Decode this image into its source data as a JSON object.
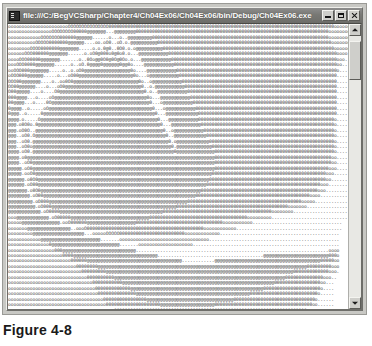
{
  "figure": {
    "caption": "Figure 4-8"
  },
  "window": {
    "title": "file:///C:/BegVCSharp/Chapter4/Ch04Ex06/Ch04Ex06/bin/Debug/Ch04Ex06.exe",
    "icon": "console-window-icon",
    "controls": {
      "minimize_label": "Minimize",
      "maximize_label": "Maximize",
      "close_label": "Close"
    }
  },
  "scrollbar": {
    "up_arrow_label": "Scroll up",
    "down_arrow_label": "Scroll down",
    "thumb_label": "Vertical scroll thumb",
    "thumb_position_percent": 2,
    "thumb_size_percent": 15
  },
  "console": {
    "background_color": "#ffffff",
    "text_color": "#3b3b3b",
    "columns": 148,
    "rows": 53,
    "output": "ooooooooooooooooooooooOOOOOOOOOOOOOOO00000000000000000000000000000000000000000000000000000000000000000000000000000000000ooooooooooooooo.....\nooooooooooooooooOOOOOOOO00000@@@@@@@...@@@@@@@@00000000000000000000000000000000000000000000000000000000000000000000000ooooooooooooo......\nooooooooooooOOOOOOO000000@@@@@@......o...o..@@@@@@@@@00000000000000000000000000000000000000000000000000000000000000000ooooooooooo.......\nooooooooooOOOOO0000000@@@@@@....oo.oO0..oO.o.@@@@@@@@@@0000000000000000000000000000000000000000000000000000000000000000oooooooo.........\nooooooooOOOO0000000@@@@@@@.....o.o.0@0..0O0.o.o@@@@@@@@@@000000000000000000000000000000000000000000000000000000000000000oooooo..........\nooooooOOO000000@@@@@@@......o.oO0@000o0@0o0.o...@@@@@@@@@@@00000000000000000000000000000000000000000000000000000000000000oooo...........\nooooOOO00000@@@@@@@.......o..0Oo@@0O0@0O@0Oo.o...@@@@@@@@@@@0000000000000000000000000000000000000000000000000000000000000ooo............\noooOOO0000@@@@@@@......o..oO.0@@@@0@@@@@@0@@0o....@@@@@@@@@@@000000000000000000000000000000000000000000000000000000000000oo.............\nooOOO000@@@@@@@.....o..o.oO0@@@@@@@@@@@@@@@@@0o....@@@@@@@@@@@00000000000000000000000000000000000000000000000000000000000o..............\noOOO000@@@@@@.....o...oO00@@@@@@@@@@@@@@@@@@@@0o...o@@@@@@@@@@@0000000000000000000000000000000000000000000000000000000000...............\nOOO00@@@@@@@....o..oo0O0@@@@@@@@@@@@@@@@@@@@@@@@0o..o@@@@@@@@@@@000000000000000000000000000000000000000000000000000000000...............\nOO00@@@@@@....o...oO0@@@@@@@@@@@@@@@@@@@@@@@@@@@@0..o.@@@@@@@@@@@00000000000000000000000000000000000000000000000000000000...............\nO00@@@@@....o....O0@@@@@@@@@@@@@@@@@@@@@@@@@@@@@@@0.o..@@@@@@@@@@@0000000000000000000000000000000000000000000000000000000...............\n000@@@@...o....oO@@@@@@@@@@@@@@@@@@@@@@@@@@@@@@@@@@0o...@@@@@@@@@@@000000000000000000000000000000000000000000000000000000...............\n00@@@@...o....0O@@@@@@@@@@@@@@@@@@@@@@@@@@@@@@@@@@@@0...o@@@@@@@@@@@00000000000000000000000000000000000000000000000000000...............\n0@@@@..o.....oO@@@@@@@@@@@@@@@@@@@@@@@@@@@@@@@@@@@@@@0...o@@@@@@@@@@@0000000000000000000000000000000000000000000000000000...............\n0@@@..o.....0@@@@@@@@@@@@@@@@@@@@@@@@@@@@@@@@@@@@@@@@@0...@@@@@@@@@@@@000000000000000000000000000000000000000000000000000...............\n@@@@.o.....O@@@@@@@@@@@@@@@@@@@@@@@@@@@@@@@@@@@@@@@@@@@0...@@@@@@@@@@@00000000000000000000000000000000000000000000000000o...............\n@@@.o0O0o.0@@@@@@@@@@@@@@@@@@@@@@@@@@@@@@@@@@@@@@@@@@@@@0...@@@@@@@@@@@0000000000000000000000000000000000000000000000000o...............\n@@@.oO0O..@@@@@@@@@@@@@@@@@@@@@@@@@@@@@@@@@@@@@@@@@@@@@@@0..o@@@@@@@@@@@000000000000000000000000000000000000000000000000o...............\n@@@..oO0.O@@@@@@@@@@@@@@@@@@@@@@@@@@@@@@@@@@@@@@@@@@@@@@@@0..@@@@@@@@@@@@00000000000000000000000000000000000000000000000o...............\n@@@..oO0.@@@@@@@@@@@@@@@@@@@@@@@@@@@@@@@@@@@@@@@@@@@@@@@@@@0.o@@@@@@@@@@@@0000000000000000000000000000000000000000000000o...............\n@@@..oO0o@@@@@@@@@@@@@@@@@@@@@@@@@@@@@@@@@@@@@@@@@@@@@@@@@@@0.@@@@@@@@@@@@@000000000000000000000000000000000000000000000o...............\n@@@@.oO0.@@@@@@@@@@@@@@@@@@@@@@@@@@@@@@@@@@@@@@@@@@@@@@@@@@@@0@@@@@@@@@@@@@@00000000000000000000000000000000000000000000o...............\n@@@@.o0@@@@@@@@@@@@@@@@@@@@@@@@@@@@@@@@@@@@@@@@@@@@@@@@@@@@@@@@@@@@@@@@@@@@@0000000000000000000000000000000000000000000oo...............\n@@@@..oO0@@@@@@@@@@@@@@@@@@@@@@@@@@@@@@@@@@@@@@@@@@@@@@@@@@@@@@@@@@@@@@@@@@@0000000000000000000000000000000000000000000oo...............\n@@@@@.oO0@@@@@@@@@@@@@@@@@@@@@@@@@@@@@@@@@@@@@@@@@@@@@@@@@@@@@@@@@@@@@@@@@@@000000000000000000000000000000000000000000ooo...............\n@@@@@.ooO0@@@@@@@@@@@@@@@@@@@@@@@@@@@@@@@@@@@@@@@@@@@@@@@@@@@@@@@@@@@@@@@@@000000000000000000000000000000000000000000ooo................\n@@@@@@.o0O0@@@@@@@@@@@@@@@@@@@@@@@@@@@@@@@@@@@@@@@@@@@@@@@@@@@@@@@@@@@@@@@0000000000000000000000000000000000000000000oo.................\n@@@@@@.oO00@@@@@@@@@@@@@@@@@@@@@@@@@@@@@@@@@@@@@@@@@@@@@@@@@@@@@@@@@@@@@@000000000000000000000000000000000000000000ooo..................\n@@@@@@@.o0O0@@@@@@@@@@@@@@@@@@@@@@@@@@@@@@@@@@@@@@@@@@@@@@@@@@@@@@@@@@@0000000000000000000000000000000000000000000ooo...................\n@@@@@@@@.oO00@@@@@@@@@@@@@@@@@@@@@@@@@@@@@@@@@@@@@@@@@@@@@@@@@@@@@@@@000000000000000000000000000000000000000000oooo....................\n@@@@@@@@@.oO000@@@@@@@@@@@@@@@@@@@@@@@@@@@@@@@@@@@@@@@@@@@@@@@@@@@000000000000000000000000000000000000000000ooooo.....................\n@@@@@@@@@@.oO000@@@@@@@@@@@@@@@@@@@@@@@@@@@@@@@@@@@@@@@@@@@@@@00000000000000000000000000000000000000000ooooooo.......................\n@@@@@@@@@@@@.oO0000@@@@@@@@@@@@@@@@@@@@@@@@@@@@@@@@@@@@@@0000000000000000000000000000000000000000oooooooo..........................\nooo@@@@@@@@@@@@.oO00000@@@@@@@@@@@@@@@@@@@@@@@@@@@@@000000000000000000000000000000000000ooooooooo..............................\nooooo@@@@@@@@@@@@@@.ooO000000@@@@@@@@@@@@@@@@@@00000000000000000000000000000000ooooooooooo.................................\nooooooo@@@@@@@@@@@@@@@@..oooO0000000000000000000000000000000000000000000oooooooooooo.......................................\nooooooooo@@@@@@@@@@@@@@@@@@@...oooooOOOOO000000000000000000000000ooooooooooooo............................................\noooooooooooo@@@@@@@@@@@@@@@@@@@@@@.......ooooooooooooooooooooooooooooooooo................................................\nooooooooooooooo0@@@@@@@@@@@@@@@@@@@@@@@@@.......oooooooooooooooooooo......................................................\nooooooooooooooooo000@@@@@@@@@@@@@@@@@@@@@@@@@@@.......................................................................oooo\noooooooooooooooooooo0000@@@@@@@@@@@@@@@@@@@@@@@@@@@@@@@.......................................@@@@@@@@@@@@@@@@@@@@@@@@000o\nooooooooooooooooooooooo000000@@@@@@@@@@@@@@@@@@@@@@@@@@@@@@@@@@@............@@@@@@@@@@@@@@@@@@@@@@@@@@@@@@@@@@@@@@@00000oo\nooooooooooooooooooooooooo00000000@@@@@@@@@@@@@@@@@@@@@@@@@@@@@@@@@@@@@@@@@@@@@@@@@@@@@@@@@@@@@@@@@@@@@@@@@@@@@000000000ooo\nooooooooooooooooooooooooooo000000000@@@@@@@@@@@@@@@@@@@@@@@@@@@@@@@@@@@@@@@@@@@@@@@@@@@@@@@@@@@@@@@@@@@@@0000000000000ooo.\nooooooooooooooooooooooooooooo0000000000@@@@@@@@@@@@@@@@@@@@@@@@@@@@@@@@@@@@@@@@@@@@@@@@@@@@@@@@@@@@@@@00000000000000ooo..\nooooooooooooooooooooooooooooooo00000000000@@@@@@@@@@@@@@@@@@@@@@@@@@@@@@@@@@@@@@@@@@@@@@@@@@@@@@@@00000000000000000oo...\noooooooooooooooooooooooooooooooo0000000000000@@@@@@@@@@@@@@@@@@@@@@@@@@@@@@@@@@@@@@@@@@@@@@@@@000000000000000000000o....\nooooooooooooooooooooooooooooooooo00000000000000@@@@@@@@@@@@@@@@@@@@@@@@@@@@@@@@@@@@@@@@@@0000000000000000000000000o.....\nooooooooooooooooooooooooooooooooooo0000000000000000@@@@@@@@@@@@@@@@@@@@@@@@@@@@@@@@000000000000000000000000000000o......\noooooooooooooooooooooooooooooooooooo00000000000000000000@@@@@@@@@@@@@@@@@@@@000000000000000000000000000000000000oo......\nooooooooooooooooooooooooooooooooooooooo00000000000000000000000000000000000000000000000000000000000000000000000ooooo.....\nooooooooooooooooooooooooooooooooooooooooo0000000000000000000000000000000000000000000000000000000000000000ooooooooo......"
  }
}
